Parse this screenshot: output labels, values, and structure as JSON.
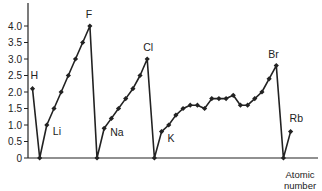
{
  "chart_data": {
    "type": "line",
    "title": "",
    "xlabel": "Atomic number",
    "ylabel": "",
    "ylim": [
      0,
      4.0
    ],
    "y_ticks": [
      "0",
      "0.5",
      "1.0",
      "1.5",
      "2.0",
      "2.5",
      "3.0",
      "3.5",
      "4.0"
    ],
    "grid": false,
    "legend": null,
    "series": [
      {
        "name": "Electronegativity",
        "x": [
          1,
          2,
          3,
          4,
          5,
          6,
          7,
          8,
          9,
          10,
          11,
          12,
          13,
          14,
          15,
          16,
          17,
          18,
          19,
          20,
          21,
          22,
          23,
          24,
          25,
          26,
          27,
          28,
          29,
          30,
          31,
          32,
          33,
          34,
          35,
          36,
          37
        ],
        "values": [
          2.1,
          0,
          1.0,
          1.5,
          2.0,
          2.5,
          3.0,
          3.5,
          4.0,
          0,
          0.9,
          1.2,
          1.5,
          1.8,
          2.1,
          2.5,
          3.0,
          0,
          0.8,
          1.0,
          1.3,
          1.5,
          1.6,
          1.6,
          1.5,
          1.8,
          1.8,
          1.8,
          1.9,
          1.6,
          1.6,
          1.8,
          2.0,
          2.4,
          2.8,
          0,
          0.8
        ]
      }
    ],
    "annotations": [
      {
        "label": "H",
        "x": 1
      },
      {
        "label": "Li",
        "x": 3
      },
      {
        "label": "F",
        "x": 9
      },
      {
        "label": "Na",
        "x": 11
      },
      {
        "label": "Cl",
        "x": 17
      },
      {
        "label": "K",
        "x": 19
      },
      {
        "label": "Br",
        "x": 35
      },
      {
        "label": "Rb",
        "x": 37
      }
    ]
  },
  "axis": {
    "x_label_line1": "Atomic",
    "x_label_line2": "number"
  }
}
